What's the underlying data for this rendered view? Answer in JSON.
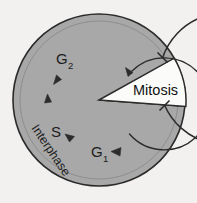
{
  "diagram": {
    "type": "cycle-diagram",
    "background_color": "#f2f1ef",
    "interphase_fill": "#a8a8a8",
    "mitosis_fill": "#fbfbf9",
    "stroke_color": "#2b2b2b"
  },
  "circle": {
    "center_x": 99,
    "center_y": 100,
    "radius": 86
  },
  "wedge": {
    "label": "Mitosis",
    "apex_x": 99,
    "apex_y": 100,
    "start_angle_deg": -29,
    "end_angle_deg": 4,
    "label_x": 156,
    "label_y": 90
  },
  "interphase": {
    "label": "Interphase",
    "label_x": 42,
    "label_y": 147,
    "rotation_deg": -56
  },
  "phases": [
    {
      "name": "G2",
      "base": "G",
      "sub": "2",
      "x": 62,
      "y": 63
    },
    {
      "name": "S",
      "base": "S",
      "sub": "",
      "x": 55,
      "y": 137
    },
    {
      "name": "G1",
      "base": "G",
      "sub": "1",
      "x": 97,
      "y": 157
    }
  ],
  "arcs": [
    {
      "name": "outer-arc",
      "radius": 70,
      "start_angle_deg": 6,
      "end_angle_deg": -33,
      "cap_start": "tick",
      "cap_end": "tick",
      "direction": "counterclockwise"
    },
    {
      "name": "inner-arc",
      "radius": 50,
      "start_angle_deg": 30,
      "end_angle_deg": -20,
      "cap_end": "arrow",
      "direction": "counterclockwise"
    }
  ],
  "arrowheads": [
    {
      "name": "arrow-to-g2-top",
      "x": 130,
      "y": 70,
      "angle_deg": 52
    },
    {
      "name": "arrow-to-g2",
      "x": 57,
      "y": 77,
      "angle_deg": -68
    },
    {
      "name": "arrow-to-s-upper",
      "x": 48,
      "y": 97,
      "angle_deg": -94
    },
    {
      "name": "arrow-to-s",
      "x": 67,
      "y": 136,
      "angle_deg": -150
    },
    {
      "name": "arrow-to-g1",
      "x": 113,
      "y": 151,
      "angle_deg": 188
    }
  ]
}
